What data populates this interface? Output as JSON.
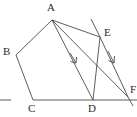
{
  "figure": {
    "type": "line-diagram",
    "width": 137,
    "height": 117,
    "background_color": "#ffffff",
    "stroke_color": "#4a4a4a",
    "label_color": "#2b2b2b",
    "stroke_width": 0.9
  },
  "points": [
    {
      "id": "A",
      "label": "A",
      "x": 52,
      "y": 20,
      "label_x": 47,
      "label_y": 3
    },
    {
      "id": "B",
      "label": "B",
      "x": 16,
      "y": 55,
      "label_x": 3,
      "label_y": 47
    },
    {
      "id": "C",
      "label": "C",
      "x": 33,
      "y": 100,
      "label_x": 28,
      "label_y": 103
    },
    {
      "id": "D",
      "label": "D",
      "x": 93,
      "y": 100,
      "label_x": 88,
      "label_y": 103
    },
    {
      "id": "E",
      "label": "E",
      "x": 100,
      "y": 37,
      "label_x": 104,
      "label_y": 28
    },
    {
      "id": "F",
      "label": "F",
      "x": 128,
      "y": 97,
      "label_x": 129,
      "label_y": 85
    }
  ],
  "segments": [
    {
      "id": "AB",
      "from": "A",
      "to": "B",
      "name": "segment-a-b"
    },
    {
      "id": "BC",
      "from": "B",
      "to": "C",
      "name": "segment-b-c"
    },
    {
      "id": "CD",
      "from": "C",
      "to": "D",
      "name": "segment-c-d"
    },
    {
      "id": "AD",
      "from": "A",
      "to": "D",
      "name": "segment-a-d"
    },
    {
      "id": "AE",
      "from": "A",
      "to": "E",
      "name": "segment-a-e"
    },
    {
      "id": "AF",
      "from": "A",
      "to": "F",
      "name": "segment-a-f"
    },
    {
      "id": "EF",
      "from": "E",
      "to": "F",
      "name": "segment-e-f"
    },
    {
      "id": "ED",
      "from": "E",
      "to": "D",
      "name": "segment-e-d"
    }
  ],
  "rays": [
    {
      "id": "baseline-left-tick",
      "x1": 0,
      "y1": 100,
      "x2": 11,
      "y2": 100,
      "name": "baseline-left-tick"
    },
    {
      "id": "baseline-right",
      "x1": 93,
      "y1": 100,
      "x2": 137,
      "y2": 100,
      "name": "baseline-right-extension"
    },
    {
      "id": "ed-extension",
      "x1": 100,
      "y1": 37,
      "x2": 91,
      "y2": 19,
      "name": "line-e-d-extension-above-e"
    },
    {
      "id": "af-extension",
      "x1": 128,
      "y1": 97,
      "x2": 133,
      "y2": 106,
      "name": "line-a-f-extension-below-f"
    }
  ],
  "parallel_marks": [
    {
      "id": "mark-ad",
      "on_segment": "AD",
      "x": 75,
      "y": 60,
      "angle_deg": 58,
      "name": "parallel-arrow-on-a-d"
    },
    {
      "id": "mark-ef",
      "on_segment": "EF",
      "x": 113,
      "y": 59,
      "angle_deg": 63,
      "name": "parallel-arrow-on-e-f"
    }
  ],
  "labels": {
    "A": "A",
    "B": "B",
    "C": "C",
    "D": "D",
    "E": "E",
    "F": "F"
  }
}
